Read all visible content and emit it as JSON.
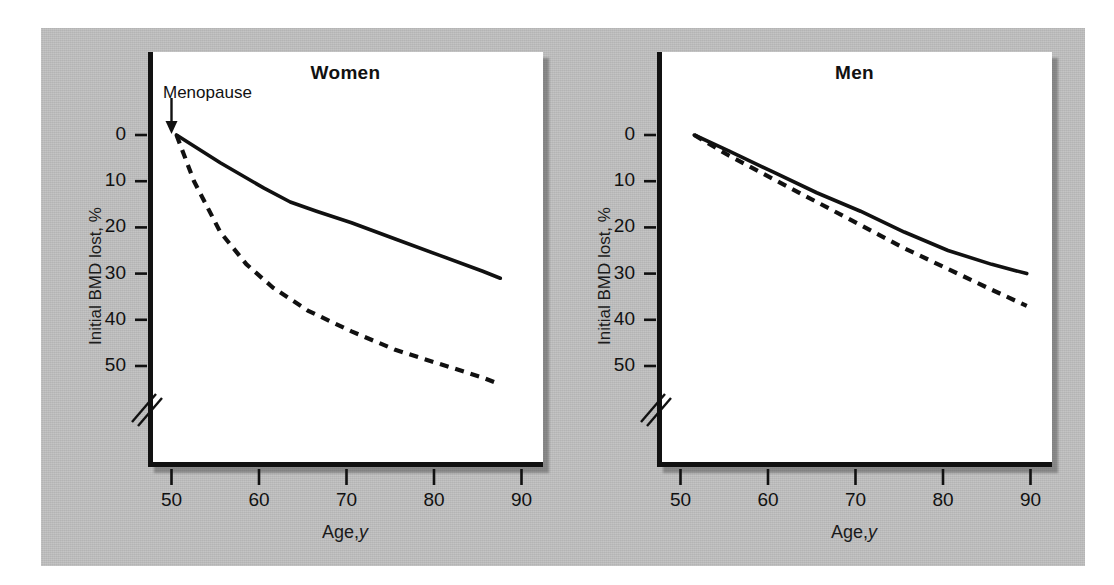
{
  "figure": {
    "background_color": "#b9b9b9",
    "plot_background": "#ffffff",
    "line_color": "#111111"
  },
  "panels": [
    {
      "id": "women",
      "title": "Women",
      "annotation": "Menopause",
      "xlabel_main": "Age,",
      "xlabel_italic": "y",
      "ylabel": "Initial BMD lost, %"
    },
    {
      "id": "men",
      "title": "Men",
      "xlabel_main": "Age,",
      "xlabel_italic": "y",
      "ylabel": "Initial BMD lost, %"
    }
  ],
  "axes": {
    "yticks": [
      "0",
      "10",
      "20",
      "30",
      "40",
      "50"
    ],
    "xticks": [
      "50",
      "60",
      "70",
      "80",
      "90"
    ],
    "y_axis_break": true
  },
  "chart_data": [
    {
      "type": "line",
      "title": "Women",
      "xlabel": "Age, y",
      "ylabel": "Initial BMD lost, %",
      "xlim": [
        48,
        92
      ],
      "ylim": [
        0,
        58
      ],
      "y_inverted": true,
      "grid": false,
      "legend": null,
      "annotations": [
        {
          "text": "Menopause",
          "x": 50,
          "y": 0
        }
      ],
      "series": [
        {
          "name": "Cortical bone (solid)",
          "style": "solid",
          "x": [
            50,
            55,
            60,
            63,
            66,
            70,
            75,
            80,
            85,
            87
          ],
          "values": [
            0,
            6,
            11.5,
            14.5,
            16.5,
            19,
            22.5,
            26,
            29.5,
            31
          ]
        },
        {
          "name": "Trabecular bone (dashed)",
          "style": "dashed",
          "x": [
            50,
            52,
            55,
            58,
            61,
            65,
            70,
            75,
            80,
            85,
            87
          ],
          "values": [
            0,
            10,
            21,
            28,
            33,
            38,
            42.5,
            46.5,
            49.5,
            52.5,
            54
          ]
        }
      ]
    },
    {
      "type": "line",
      "title": "Men",
      "xlabel": "Age, y",
      "ylabel": "Initial BMD lost, %",
      "xlim": [
        48,
        92
      ],
      "ylim": [
        0,
        58
      ],
      "y_inverted": true,
      "grid": false,
      "legend": null,
      "annotations": [],
      "series": [
        {
          "name": "Cortical bone (solid)",
          "style": "solid",
          "x": [
            51,
            55,
            60,
            65,
            70,
            75,
            80,
            85,
            89
          ],
          "values": [
            0,
            3.5,
            8,
            12.5,
            16.5,
            21,
            25,
            28,
            30
          ]
        },
        {
          "name": "Trabecular bone (dashed)",
          "style": "dashed",
          "x": [
            51,
            55,
            60,
            65,
            70,
            75,
            80,
            85,
            89
          ],
          "values": [
            0,
            4.5,
            9.5,
            14.5,
            19.5,
            24.5,
            29,
            33.5,
            37
          ]
        }
      ]
    }
  ]
}
